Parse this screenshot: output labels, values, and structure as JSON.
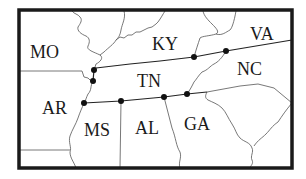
{
  "map": {
    "title": "Tennessee and surrounding states",
    "colors": {
      "background": "#ffffff",
      "frame": "#1a1a1a",
      "borders": "#555555",
      "points": "#111111"
    },
    "states": [
      {
        "abbr": "MO",
        "x": 30,
        "y": 58
      },
      {
        "abbr": "KY",
        "x": 152,
        "y": 50
      },
      {
        "abbr": "VA",
        "x": 250,
        "y": 40
      },
      {
        "abbr": "TN",
        "x": 137,
        "y": 87
      },
      {
        "abbr": "NC",
        "x": 237,
        "y": 75
      },
      {
        "abbr": "AR",
        "x": 42,
        "y": 114
      },
      {
        "abbr": "MS",
        "x": 84,
        "y": 136
      },
      {
        "abbr": "AL",
        "x": 135,
        "y": 134
      },
      {
        "abbr": "GA",
        "x": 184,
        "y": 130
      }
    ],
    "points": [
      {
        "id": "p1",
        "x": 94,
        "y": 70
      },
      {
        "id": "p2",
        "x": 93,
        "y": 81
      },
      {
        "id": "p3",
        "x": 84,
        "y": 103
      },
      {
        "id": "p4",
        "x": 121,
        "y": 101
      },
      {
        "id": "p5",
        "x": 164,
        "y": 97
      },
      {
        "id": "p6",
        "x": 187,
        "y": 94
      },
      {
        "id": "p7",
        "x": 194,
        "y": 57
      },
      {
        "id": "p8",
        "x": 226,
        "y": 51
      }
    ]
  }
}
